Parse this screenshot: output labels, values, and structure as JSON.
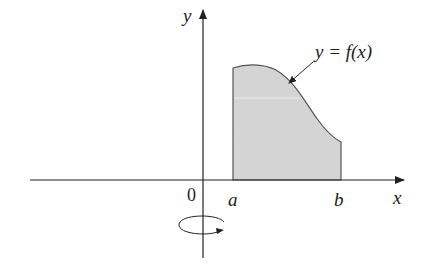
{
  "diagram": {
    "axes": {
      "x_label": "x",
      "y_label": "y",
      "origin_label": "0"
    },
    "region": {
      "left_bound_label": "a",
      "right_bound_label": "b",
      "fill_color": "#d4d4d4",
      "stroke_color": "#555555"
    },
    "curve_label": "y = f(x)",
    "rotation_indicator": "rotation about y-axis"
  }
}
